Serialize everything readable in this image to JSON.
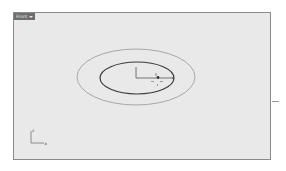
{
  "viewport": {
    "title": "Front",
    "title_dropdown_icon": "chevron-down-icon",
    "background": "#e9e9e9",
    "border_color": "#8a8a8a"
  },
  "axis_indicator": {
    "vertical_label": "z",
    "horizontal_label": "x"
  },
  "objects": {
    "outer_ellipse": {
      "cx": 136,
      "cy": 77,
      "rx": 59,
      "ry": 28,
      "color": "#a8a8a8"
    },
    "inner_ellipse": {
      "cx": 137,
      "cy": 78,
      "rx": 37,
      "ry": 16,
      "color": "#3a3a3a"
    }
  }
}
